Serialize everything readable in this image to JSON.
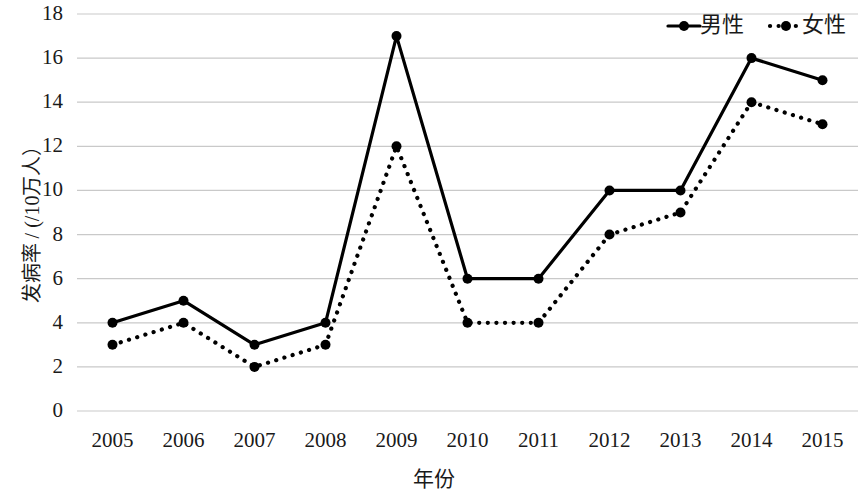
{
  "chart_data": {
    "type": "line",
    "title": "",
    "xlabel": "年份",
    "ylabel": "发病率 / (/10万人）",
    "categories": [
      "2005",
      "2006",
      "2007",
      "2008",
      "2009",
      "2010",
      "2011",
      "2012",
      "2013",
      "2014",
      "2015"
    ],
    "series": [
      {
        "name": "男性",
        "style": "solid",
        "color": "#000000",
        "marker": "filled-circle",
        "values": [
          4,
          5,
          3,
          4,
          17,
          6,
          6,
          10,
          10,
          16,
          15
        ]
      },
      {
        "name": "女性",
        "style": "dotted",
        "color": "#000000",
        "marker": "filled-circle",
        "values": [
          3,
          4,
          2,
          3,
          12,
          4,
          4,
          8,
          9,
          14,
          13
        ]
      }
    ],
    "ylim": [
      0,
      18
    ],
    "ytick_step": 2,
    "yticks": [
      "0",
      "2",
      "4",
      "6",
      "8",
      "10",
      "12",
      "14",
      "16",
      "18"
    ],
    "grid": "horizontal",
    "legend_position": "top-right",
    "background_color": "#ffffff",
    "gridline_color": "#c9c9c9"
  },
  "legend": {
    "entries": [
      {
        "label": "男性"
      },
      {
        "label": "女性"
      }
    ]
  }
}
